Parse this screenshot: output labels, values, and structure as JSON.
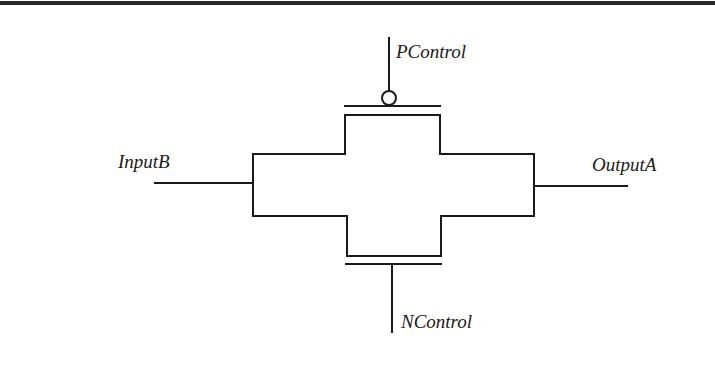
{
  "diagram": {
    "type": "transmission-gate",
    "labels": {
      "p_control": "PControl",
      "n_control": "NControl",
      "input": "InputB",
      "output": "OutputA"
    },
    "colors": {
      "stroke": "#1a1a1a",
      "background": "#ffffff",
      "top_rule": "#2a2a2a"
    }
  }
}
